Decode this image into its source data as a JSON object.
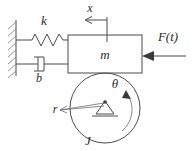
{
  "figure": {
    "background_color": "#ffffff",
    "line_color": "#4a4a4a",
    "text_color": "#2b2b2b",
    "width": 194,
    "height": 151
  },
  "labels": {
    "spring": "k",
    "damper": "b",
    "mass": "m",
    "displacement": "x",
    "force": "F(t)",
    "angle": "θ",
    "radius": "r",
    "inertia": "J"
  },
  "components": {
    "wall": {
      "name": "fixed-wall",
      "hatched": true
    },
    "spring": {
      "name": "spring-k",
      "coils": 5
    },
    "damper": {
      "name": "damper-b",
      "type": "dashpot"
    },
    "mass_block": {
      "name": "mass-m",
      "shape": "rectangle"
    },
    "disk": {
      "name": "rotating-disk-J",
      "shape": "circle"
    },
    "pivot": {
      "name": "pivot-support",
      "shape": "triangle"
    },
    "force_arrow": {
      "name": "force-arrow",
      "direction": "left"
    },
    "displacement_arrow": {
      "name": "displacement-arrow",
      "direction": "left"
    },
    "angle_arrow": {
      "name": "angle-arc-arrow",
      "direction": "clockwise"
    },
    "radius_line": {
      "name": "radius-leader-line"
    }
  }
}
